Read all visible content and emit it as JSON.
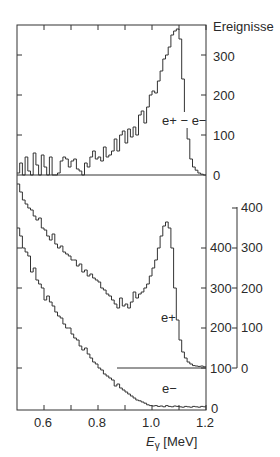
{
  "chart_data": [
    {
      "panel": "top",
      "type": "line",
      "drawstyle": "steps",
      "title": "",
      "xlabel": "E_γ [MeV]",
      "ylabel": "Ereignisse",
      "xlim": [
        0.5,
        1.2
      ],
      "ylim": [
        0,
        370
      ],
      "yticks": [
        0,
        100,
        200,
        300
      ],
      "series": [
        {
          "name": "e+ − e−",
          "x_start": 0.5,
          "bin_width": 0.01,
          "values": [
            5,
            30,
            0,
            45,
            10,
            0,
            55,
            25,
            0,
            50,
            20,
            0,
            45,
            0,
            0,
            5,
            35,
            45,
            40,
            20,
            35,
            40,
            15,
            10,
            0,
            30,
            20,
            45,
            60,
            40,
            45,
            35,
            70,
            45,
            50,
            60,
            90,
            60,
            100,
            110,
            80,
            115,
            95,
            120,
            100,
            150,
            160,
            130,
            170,
            200,
            210,
            205,
            235,
            260,
            290,
            300,
            320,
            350,
            360,
            365,
            340,
            240,
            150,
            90,
            40,
            20,
            12,
            5,
            2,
            0,
            3,
            0,
            2,
            0,
            4,
            0
          ]
        }
      ],
      "annotations": [
        "e+ − e−"
      ]
    },
    {
      "panel": "bottom",
      "type": "line",
      "drawstyle": "steps",
      "xlabel": "E_γ [MeV]",
      "xlim": [
        0.5,
        1.2
      ],
      "xticks": [
        0.6,
        0.8,
        1.0,
        1.2
      ],
      "left_axis": {
        "ylim": [
          0,
          460
        ],
        "yticks": [
          0,
          100,
          200,
          300,
          400
        ],
        "applies_to": "e−"
      },
      "right_axis": {
        "ylim": [
          0,
          460
        ],
        "yticks": [
          0,
          100,
          200,
          300,
          400
        ],
        "applies_to": "e+",
        "offset_baseline_at_left_value": 100
      },
      "series": [
        {
          "name": "e+",
          "x_start": 0.5,
          "bin_width": 0.01,
          "values": [
            460,
            440,
            420,
            410,
            400,
            395,
            380,
            370,
            375,
            350,
            345,
            330,
            320,
            335,
            310,
            300,
            305,
            290,
            285,
            280,
            270,
            270,
            255,
            260,
            240,
            245,
            230,
            235,
            225,
            220,
            215,
            200,
            195,
            185,
            180,
            170,
            160,
            150,
            175,
            155,
            160,
            150,
            165,
            190,
            175,
            185,
            190,
            200,
            210,
            230,
            250,
            270,
            300,
            330,
            355,
            365,
            350,
            300,
            200,
            120,
            70,
            40,
            25,
            15,
            10,
            6,
            5,
            4,
            5,
            3,
            4,
            5,
            3,
            6,
            4,
            5
          ],
          "annotation": "e+"
        },
        {
          "name": "e−",
          "x_start": 0.5,
          "bin_width": 0.01,
          "values": [
            450,
            430,
            400,
            390,
            380,
            340,
            350,
            320,
            310,
            300,
            270,
            280,
            265,
            255,
            240,
            230,
            225,
            210,
            200,
            200,
            185,
            175,
            170,
            155,
            145,
            150,
            135,
            125,
            115,
            110,
            100,
            95,
            85,
            80,
            75,
            70,
            55,
            60,
            50,
            45,
            40,
            35,
            30,
            25,
            20,
            18,
            15,
            12,
            8,
            6,
            5,
            6,
            4,
            5,
            3,
            6,
            4,
            3,
            5,
            4,
            3,
            2,
            4,
            3,
            2,
            4,
            3,
            2,
            4,
            3,
            2,
            3,
            2,
            4,
            2,
            3
          ],
          "annotation": "e−"
        }
      ]
    }
  ],
  "labels": {
    "ylabel": "Ereignisse",
    "top_series": "e+ − e−",
    "bottom_series_pos": "e+",
    "bottom_series_neg": "e−",
    "x_axis_prefix": "E",
    "x_axis_subscript": "γ",
    "x_axis_unit": " [MeV]",
    "top_yticks": [
      "300",
      "200",
      "100",
      "0"
    ],
    "bottom_left_yticks": [
      "400",
      "300",
      "200",
      "100",
      "0"
    ],
    "bottom_right_yticks": [
      "400",
      "300",
      "200",
      "100",
      "0"
    ],
    "xticks": [
      "0.6",
      "0.8",
      "1.0",
      "1.2"
    ]
  }
}
